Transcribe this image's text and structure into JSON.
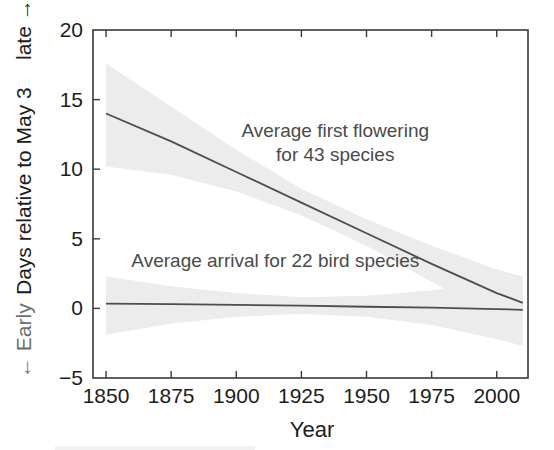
{
  "chart_data": {
    "type": "line",
    "title": "",
    "xlabel": "Year",
    "ylabel": "← Early  Days relative to May 3  late →",
    "ylabel_parts": {
      "early": "← Early",
      "main": "Days relative to May 3",
      "late": "late →"
    },
    "xlim": [
      1845,
      2012
    ],
    "ylim": [
      -5,
      20
    ],
    "xticks": [
      1850,
      1875,
      1900,
      1925,
      1950,
      1975,
      2000
    ],
    "xtick_labels": [
      "1850",
      "1875",
      "1900",
      "1925",
      "1950",
      "1975",
      "2000"
    ],
    "yticks": [
      -5,
      0,
      5,
      10,
      15,
      20
    ],
    "ytick_labels": [
      "−5",
      "0",
      "5",
      "10",
      "15",
      "20"
    ],
    "grid": false,
    "legend_position": "inline-annotation",
    "band_color": "#ececec",
    "line_color": "#4d4d4d",
    "series": [
      {
        "name": "Average first flowering for 43 species",
        "x": [
          1850,
          1875,
          1900,
          1925,
          1950,
          1975,
          2000,
          2010
        ],
        "values": [
          14.0,
          12.0,
          9.8,
          7.6,
          5.4,
          3.2,
          1.1,
          0.4
        ],
        "band_lower": [
          10.2,
          9.6,
          8.4,
          6.7,
          4.5,
          1.9,
          -0.6,
          -1.6
        ],
        "band_upper": [
          17.6,
          14.5,
          11.4,
          8.6,
          6.4,
          4.5,
          2.8,
          2.3
        ]
      },
      {
        "name": "Average arrival for 22 bird species",
        "x": [
          1850,
          1875,
          1900,
          1925,
          1950,
          1975,
          2000,
          2010
        ],
        "values": [
          0.35,
          0.3,
          0.25,
          0.2,
          0.12,
          0.05,
          -0.05,
          -0.1
        ],
        "band_lower": [
          -1.9,
          -1.1,
          -0.6,
          -0.4,
          -0.6,
          -1.2,
          -2.2,
          -2.7
        ],
        "band_upper": [
          2.3,
          1.6,
          1.1,
          0.8,
          0.9,
          1.3,
          1.9,
          2.2
        ]
      }
    ],
    "annotations": [
      {
        "id": "flowering-annotation",
        "lines": [
          "Average first flowering",
          "for 43 species"
        ],
        "x_data": 1938,
        "y_data": 12.3
      },
      {
        "id": "bird-annotation",
        "lines": [
          "Average arrival for 22 bird species"
        ],
        "x_data": 1915,
        "y_data": 3.0
      }
    ]
  }
}
